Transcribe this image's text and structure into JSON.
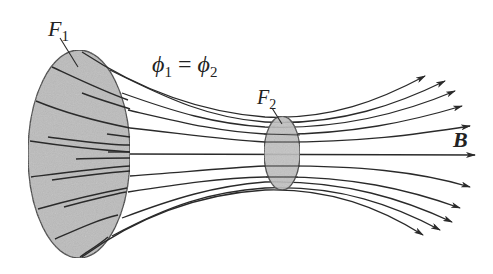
{
  "diagram": {
    "labels": {
      "surface1": {
        "main": "F",
        "sub": "1"
      },
      "surface2": {
        "main": "F",
        "sub": "2"
      },
      "equation": {
        "phi": "ϕ",
        "sub1": "1",
        "eq": " = ",
        "sub2": "2"
      },
      "field": "B"
    },
    "colors": {
      "line": "#2a2a2a",
      "surface_fill": "#b8b8b8",
      "surface_stroke": "#3a3a3a",
      "background": "#ffffff"
    },
    "surfaces": [
      {
        "name": "F1",
        "cx": 79,
        "cy": 154,
        "rx": 51,
        "ry": 104
      },
      {
        "name": "F2",
        "cx": 282,
        "cy": 153,
        "rx": 18,
        "ry": 37
      }
    ],
    "field_line_count": 11
  }
}
